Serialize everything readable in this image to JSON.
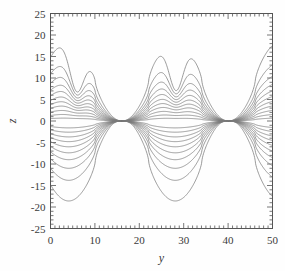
{
  "figure": {
    "background_color": "#fefefe",
    "frame_color": "#555555",
    "curve_color": "#7a7a7a",
    "text_color": "#3a3a3a"
  },
  "chart_data": {
    "type": "line",
    "title": "",
    "xlabel": "y",
    "ylabel": "z",
    "xlim": [
      0,
      50
    ],
    "ylim": [
      -25,
      25
    ],
    "grid": false,
    "legend": null,
    "x_major_ticks": [
      0,
      10,
      20,
      30,
      40,
      50
    ],
    "x_tick_labels": [
      "0",
      "10",
      "20",
      "30",
      "40",
      "50"
    ],
    "x_minor_interval": 1,
    "y_major_ticks": [
      -25,
      -20,
      -15,
      -10,
      -5,
      0,
      5,
      10,
      15,
      20,
      25
    ],
    "y_tick_labels": [
      "-25",
      "-20",
      "-15",
      "-10",
      "-5",
      "0",
      "5",
      "10",
      "15",
      "20",
      "25"
    ],
    "y_minor_interval": 1,
    "ticks_direction": "in",
    "ticks_all_sides": true,
    "n_contours": 17,
    "contour_amplitudes": [
      18.6,
      13.8,
      11.0,
      9.0,
      7.4,
      6.0,
      4.8,
      3.7,
      2.6,
      1.6,
      0.7
    ],
    "cusp_positions_down": [
      6.0,
      28.3
    ],
    "cusp_positions_up": [
      16.2,
      40.2
    ],
    "wave_period": 24.0,
    "series": [
      {
        "name": "level-+8",
        "offset": 18.6,
        "kind": "upper"
      },
      {
        "name": "level-+7",
        "offset": 13.8,
        "kind": "upper"
      },
      {
        "name": "level-+6",
        "offset": 11.0,
        "kind": "upper"
      },
      {
        "name": "level-+5",
        "offset": 9.0,
        "kind": "upper"
      },
      {
        "name": "level-+4",
        "offset": 7.4,
        "kind": "upper"
      },
      {
        "name": "level-+3",
        "offset": 6.0,
        "kind": "upper"
      },
      {
        "name": "level-+2",
        "offset": 4.8,
        "kind": "upper"
      },
      {
        "name": "level-+1",
        "offset": 3.7,
        "kind": "upper"
      },
      {
        "name": "level-+0b",
        "offset": 2.6,
        "kind": "upper"
      },
      {
        "name": "level-+0a",
        "offset": 1.6,
        "kind": "upper"
      },
      {
        "name": "level-0",
        "offset": 0.7,
        "kind": "upper"
      },
      {
        "name": "level--0a",
        "offset": 1.6,
        "kind": "lower"
      },
      {
        "name": "level--0b",
        "offset": 2.6,
        "kind": "lower"
      },
      {
        "name": "level--1",
        "offset": 3.7,
        "kind": "lower"
      },
      {
        "name": "level--2",
        "offset": 4.8,
        "kind": "lower"
      },
      {
        "name": "level--3",
        "offset": 6.0,
        "kind": "lower"
      },
      {
        "name": "level--4",
        "offset": 7.4,
        "kind": "lower"
      },
      {
        "name": "level--5",
        "offset": 9.0,
        "kind": "lower"
      },
      {
        "name": "level--6",
        "offset": 11.0,
        "kind": "lower"
      },
      {
        "name": "level--7",
        "offset": 13.8,
        "kind": "lower"
      },
      {
        "name": "level--8",
        "offset": 18.6,
        "kind": "lower"
      }
    ]
  }
}
